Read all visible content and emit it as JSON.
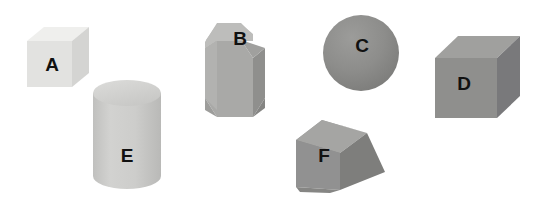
{
  "scene": {
    "title": "Six shaded 3D geometric solids labeled A through F",
    "width": 544,
    "height": 209,
    "background_color": "#ffffff",
    "label_color": "#111111"
  },
  "shapes": [
    {
      "id": "A",
      "label": "A",
      "kind": "cube",
      "description": "small light gray cube, upper left",
      "colors": {
        "front": "#e2e2e0",
        "top": "#ededeb",
        "side": "#d2d2d0"
      },
      "label_position": {
        "x": 52,
        "y": 66
      }
    },
    {
      "id": "B",
      "label": "B",
      "kind": "octagonal-prism",
      "description": "medium gray octagonal prism standing upright",
      "colors": {
        "front": "#a8a8a6",
        "top": "#b9b9b7",
        "side": "#949492"
      },
      "label_position": {
        "x": 240,
        "y": 40
      }
    },
    {
      "id": "C",
      "label": "C",
      "kind": "sphere",
      "description": "dark gray shaded sphere",
      "colors": {
        "base": "#8c8c8a",
        "highlight": "#9d9d9b",
        "shadow": "#7a7a78"
      },
      "label_position": {
        "x": 362,
        "y": 47
      }
    },
    {
      "id": "D",
      "label": "D",
      "kind": "cube",
      "description": "large dark gray cube, right side",
      "colors": {
        "front": "#8e8e8c",
        "top": "#9e9e9c",
        "side": "#79797a"
      },
      "label_position": {
        "x": 464,
        "y": 85
      }
    },
    {
      "id": "E",
      "label": "E",
      "kind": "cylinder",
      "description": "light gray upright cylinder with elliptical top",
      "colors": {
        "body": "#cbcbc9",
        "top": "#d6d6d4",
        "shadow": "#bbbbb9"
      },
      "label_position": {
        "x": 127,
        "y": 157
      }
    },
    {
      "id": "F",
      "label": "F",
      "kind": "cube-rotated",
      "description": "gray cube tilted at an angle, lower middle",
      "colors": {
        "front": "#8f8f8d",
        "top": "#a3a3a1",
        "side": "#7d7d7b"
      },
      "label_position": {
        "x": 324,
        "y": 157
      }
    }
  ]
}
